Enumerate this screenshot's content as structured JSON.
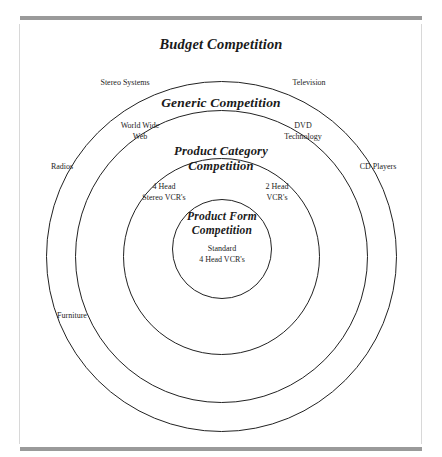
{
  "figure": {
    "type": "concentric-levels-of-competition-diagram",
    "levels": [
      {
        "id": "budget",
        "title": "Budget Competition",
        "examples": [
          "Stereo Systems",
          "Television",
          "Radios",
          "CD Players",
          "Furniture"
        ]
      },
      {
        "id": "generic",
        "title": "Generic Competition",
        "examples": [
          "World Wide\nWeb",
          "DVD\nTechnology"
        ]
      },
      {
        "id": "product-category",
        "title": "Product Category\nCompetition",
        "examples": [
          "4 Head\nStereo VCR's",
          "2 Head\nVCR's"
        ]
      },
      {
        "id": "product-form",
        "title": "Product Form\nCompetition",
        "examples": [
          "Standard\n4 Head VCR's"
        ]
      }
    ],
    "labels": {
      "stereo_systems": "Stereo Systems",
      "television": "Television",
      "world_wide_web": "World Wide\nWeb",
      "dvd_technology": "DVD\nTechnology",
      "radios": "Radios",
      "cd_players": "CD Players",
      "four_head_stereo_vcrs": "4 Head\nStereo VCR's",
      "two_head_vcrs": "2 Head\nVCR's",
      "standard_four_head_vcrs": "Standard\n4 Head VCR's",
      "furniture": "Furniture"
    },
    "titles": {
      "budget": "Budget Competition",
      "generic": "Generic Competition",
      "product_category": "Product Category\nCompetition",
      "product_form": "Product Form\nCompetition"
    },
    "colors": {
      "circle_stroke": "#222222",
      "rule_gray": "#9a9a9a",
      "text": "#1a1a1a",
      "background": "#ffffff"
    }
  }
}
